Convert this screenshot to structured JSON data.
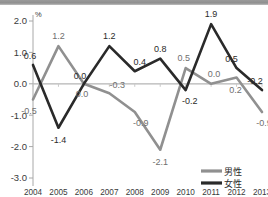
{
  "chart_data": {
    "type": "line",
    "title": "",
    "xlabel": "",
    "ylabel": "",
    "unit": "%",
    "grid": false,
    "legend_position": "bottom-right",
    "ylim": [
      -3.0,
      2.0
    ],
    "yticks": [
      "2.0",
      "1.0",
      "0.0",
      "-1.0",
      "-2.0",
      "-3.0"
    ],
    "ytick_values": [
      2.0,
      1.0,
      0.0,
      -1.0,
      -2.0,
      -3.0
    ],
    "categories": [
      "2004",
      "2005",
      "2006",
      "2007",
      "2008",
      "2009",
      "2010",
      "2011",
      "2012",
      "2013"
    ],
    "series": [
      {
        "name": "男性",
        "color": "#909090",
        "values": [
          -0.5,
          1.2,
          0.0,
          -0.3,
          -0.9,
          -2.1,
          0.5,
          0.0,
          0.2,
          -0.9
        ],
        "labels": [
          "-0.5",
          "1.2",
          "0.0",
          "-0.3",
          "-0.9",
          "-2.1",
          "0.5",
          "0.0",
          "0.2",
          "-0.9"
        ]
      },
      {
        "name": "女性",
        "color": "#2a2a2a",
        "values": [
          0.6,
          -1.4,
          0.0,
          1.2,
          0.4,
          0.8,
          -0.2,
          1.9,
          0.5,
          -0.2
        ],
        "labels": [
          "0.6",
          "-1.4",
          "0.0",
          "1.2",
          "0.4",
          "0.8",
          "-0.2",
          "1.9",
          "0.5",
          "-0.2"
        ]
      }
    ]
  },
  "legend": {
    "items": [
      {
        "label": "男性",
        "color": "#909090"
      },
      {
        "label": "女性",
        "color": "#2a2a2a"
      }
    ]
  }
}
